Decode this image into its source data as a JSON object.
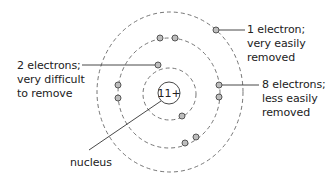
{
  "colors": {
    "line": "#333333",
    "shell": "#666666",
    "electron_fill": "#bdbdbd",
    "electron_stroke": "#555555",
    "text": "#222222"
  },
  "nucleus": {
    "label": "11+",
    "caption": "nucleus"
  },
  "shells": [
    {
      "name": "inner",
      "electron_count": 2,
      "annotation": [
        "2 electrons;",
        "very difficult",
        "to remove"
      ]
    },
    {
      "name": "middle",
      "electron_count": 8,
      "annotation": [
        "8 electrons;",
        "less easily",
        "removed"
      ]
    },
    {
      "name": "outer",
      "electron_count": 1,
      "annotation": [
        "1 electron;",
        "very easily",
        "removed"
      ]
    }
  ]
}
